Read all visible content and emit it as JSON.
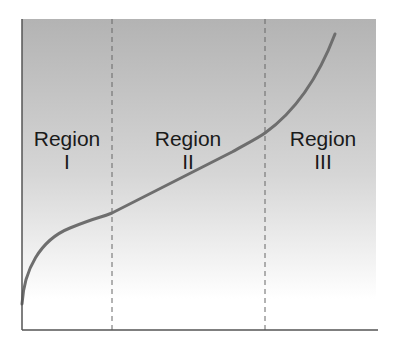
{
  "diagram": {
    "type": "regions-curve",
    "colors": {
      "background_top": "#b4b4b4",
      "background_bottom": "#ffffff",
      "curve": "#6e6e6e",
      "axis": "#555555",
      "divider": "#666666",
      "text": "#1a1a1a"
    },
    "regions": [
      {
        "name": "Region",
        "numeral": "I"
      },
      {
        "name": "Region",
        "numeral": "II"
      },
      {
        "name": "Region",
        "numeral": "III"
      }
    ],
    "dividers": 2,
    "curve_description": "S-shaped curve: steep rise in Region I, gentle linear slope in Region II, steep rise in Region III"
  }
}
